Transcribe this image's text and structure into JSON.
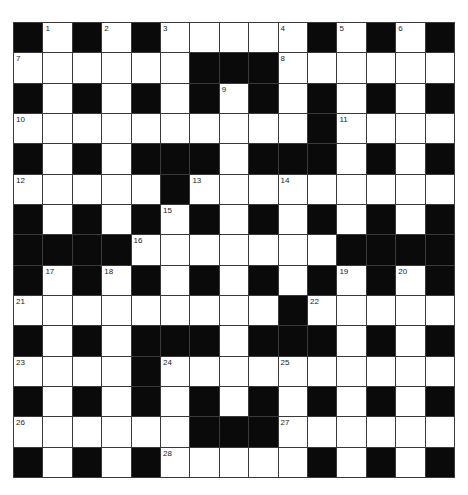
{
  "puzzle": {
    "type": "crossword",
    "rows": 15,
    "cols": 15,
    "layout": [
      "#.#.#.....#.#.#",
      "......###......",
      "#.#.#.#.#.#.#.#",
      "..........#....",
      "#.#.###.###.#.#",
      ".....#.........",
      "#.#.#.#.#.#.#.#",
      "####.......####",
      "#.#.#.#.#.#.#.#",
      ".........#.....",
      "#.#.###.###.#.#",
      "....#..........",
      "#.#.#.#.#.#.#.#",
      "......###......",
      "#.#.#.....#.#.#"
    ],
    "numbers": [
      {
        "row": 0,
        "col": 1,
        "n": "1"
      },
      {
        "row": 0,
        "col": 3,
        "n": "2"
      },
      {
        "row": 0,
        "col": 5,
        "n": "3"
      },
      {
        "row": 0,
        "col": 9,
        "n": "4"
      },
      {
        "row": 0,
        "col": 11,
        "n": "5"
      },
      {
        "row": 0,
        "col": 13,
        "n": "6"
      },
      {
        "row": 1,
        "col": 0,
        "n": "7"
      },
      {
        "row": 1,
        "col": 9,
        "n": "8"
      },
      {
        "row": 2,
        "col": 7,
        "n": "9"
      },
      {
        "row": 3,
        "col": 0,
        "n": "10"
      },
      {
        "row": 3,
        "col": 11,
        "n": "11"
      },
      {
        "row": 5,
        "col": 0,
        "n": "12"
      },
      {
        "row": 5,
        "col": 6,
        "n": "13"
      },
      {
        "row": 5,
        "col": 9,
        "n": "14"
      },
      {
        "row": 6,
        "col": 5,
        "n": "15"
      },
      {
        "row": 7,
        "col": 4,
        "n": "16"
      },
      {
        "row": 8,
        "col": 1,
        "n": "17"
      },
      {
        "row": 8,
        "col": 3,
        "n": "18"
      },
      {
        "row": 8,
        "col": 11,
        "n": "19"
      },
      {
        "row": 8,
        "col": 13,
        "n": "20"
      },
      {
        "row": 9,
        "col": 0,
        "n": "21"
      },
      {
        "row": 9,
        "col": 10,
        "n": "22"
      },
      {
        "row": 11,
        "col": 0,
        "n": "23"
      },
      {
        "row": 11,
        "col": 5,
        "n": "24"
      },
      {
        "row": 11,
        "col": 9,
        "n": "25"
      },
      {
        "row": 13,
        "col": 0,
        "n": "26"
      },
      {
        "row": 13,
        "col": 9,
        "n": "27"
      },
      {
        "row": 14,
        "col": 5,
        "n": "28"
      }
    ],
    "colors": {
      "block": "#0a0a0a",
      "cell": "#ffffff",
      "border": "#3a3a3a"
    }
  }
}
